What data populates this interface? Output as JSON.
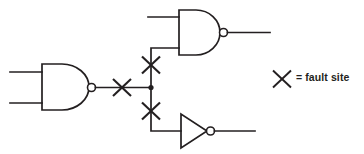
{
  "figure": {
    "background_color": "#ffffff",
    "line_color": "#231f20",
    "width": 364,
    "height": 154
  },
  "legend": {
    "symbol": "fault-site-x-icon",
    "label": "= fault site",
    "x": 282,
    "y": 79
  },
  "gates": [
    {
      "id": "nand-left",
      "type": "NAND",
      "name": "left-nand-gate",
      "body": {
        "x": 41,
        "y": 64,
        "width": 47,
        "height": 46
      },
      "bubble": {
        "cx": 91.5,
        "cy": 87.5,
        "r": 4
      },
      "inputs": [
        {
          "name": "left-nand-input-a",
          "x1": 10,
          "y1": 72,
          "x2": 42,
          "y2": 72
        },
        {
          "name": "left-nand-input-b",
          "x1": 10,
          "y1": 103,
          "x2": 42,
          "y2": 103
        }
      ],
      "output": {
        "name": "left-nand-output-wire",
        "x1": 95.5,
        "y1": 87.5,
        "x2": 151,
        "y2": 87.5
      }
    },
    {
      "id": "nand-top",
      "type": "NAND",
      "name": "top-nand-gate",
      "body": {
        "x": 178,
        "y": 10,
        "width": 42,
        "height": 45
      },
      "bubble": {
        "cx": 223.5,
        "cy": 32.5,
        "r": 4
      },
      "inputs": [
        {
          "name": "top-nand-input-a",
          "x1": 148,
          "y1": 17,
          "x2": 179,
          "y2": 17
        },
        {
          "name": "top-nand-input-b",
          "x1": 151,
          "y1": 48,
          "x2": 179,
          "y2": 48
        }
      ],
      "output": {
        "name": "top-nand-output-wire",
        "x1": 227.5,
        "y1": 32.5,
        "x2": 270,
        "y2": 32.5
      }
    },
    {
      "id": "inverter-bottom",
      "type": "NOT",
      "name": "bottom-inverter-gate",
      "body": {
        "x": 180,
        "y": 114,
        "width": 27,
        "height": 34
      },
      "bubble": {
        "cx": 210.5,
        "cy": 131,
        "r": 4
      },
      "inputs": [
        {
          "name": "inverter-input",
          "x1": 151,
          "y1": 131,
          "x2": 181,
          "y2": 131
        }
      ],
      "output": {
        "name": "inverter-output-wire",
        "x1": 214.5,
        "y1": 131,
        "x2": 255,
        "y2": 131
      }
    }
  ],
  "nets": [
    {
      "name": "fanout-junction",
      "type": "dot",
      "x": 151,
      "y": 87.5,
      "r": 2.6
    },
    {
      "name": "fanout-branch-up",
      "type": "polyline",
      "points": "151,87.5 151,48 179,48"
    },
    {
      "name": "fanout-branch-down",
      "type": "polyline",
      "points": "151,87.5 151,131 181,131"
    }
  ],
  "fault_sites": [
    {
      "name": "fault-site-on-nand-output",
      "cx": 122,
      "cy": 87.5,
      "size": 19
    },
    {
      "name": "fault-site-on-upper-branch",
      "cx": 151,
      "cy": 65,
      "size": 19
    },
    {
      "name": "fault-site-on-lower-branch",
      "cx": 151,
      "cy": 111,
      "size": 19
    }
  ]
}
